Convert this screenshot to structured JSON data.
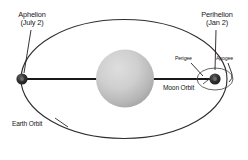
{
  "diagram": {
    "labels": {
      "aphelion": {
        "name": "Aphelion",
        "date": "(July 2)"
      },
      "perihelion": {
        "name": "Perihelion",
        "date": "(Jan 2)"
      },
      "perigee": "Perigee",
      "apogee": "Apogee",
      "moon_orbit": "Moon Orbit",
      "earth_orbit": "Earth Orbit"
    },
    "bodies": {
      "sun": {
        "name": "sun",
        "cx": 125,
        "cy": 78,
        "r": 29,
        "fill_light": "#d6d6d6",
        "fill_dark": "#9a9a9a"
      },
      "earth_aphelion": {
        "name": "earth-at-aphelion",
        "cx": 22,
        "cy": 79,
        "r": 5.4,
        "fill": "#2b2b2b"
      },
      "earth_perihelion": {
        "name": "earth-at-perihelion",
        "cx": 215,
        "cy": 79,
        "r": 5.4,
        "fill": "#2b2b2b"
      }
    },
    "orbits": {
      "earth": {
        "cx": 124,
        "cy": 79,
        "rx": 103,
        "ry": 60,
        "stroke": "#2e2e2e",
        "stroke_width": 1.2
      },
      "moon": {
        "cx": 215,
        "cy": 79,
        "rx": 18,
        "ry": 11,
        "stroke": "#4a4a4a",
        "stroke_width": 0.9
      }
    },
    "axis_line": {
      "name": "major-axis",
      "x1": 22,
      "y1": 79,
      "x2": 215,
      "y2": 79,
      "stroke": "#1a1a1a",
      "stroke_width": 1.7
    },
    "colors": {
      "background": "#ffffff",
      "ink": "#17171a",
      "orbit_stroke": "#2e2e2e",
      "body_dark": "#2b2b2b"
    }
  }
}
